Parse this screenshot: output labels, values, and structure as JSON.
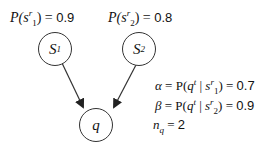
{
  "nodes": [
    {
      "id": "s1",
      "label": "S",
      "sub": "1"
    },
    {
      "id": "s2",
      "label": "S",
      "sub": "2"
    },
    {
      "id": "q",
      "label": "q"
    }
  ],
  "edges": [
    {
      "from": "s1",
      "to": "q"
    },
    {
      "from": "s2",
      "to": "q"
    }
  ],
  "priors": {
    "s1": {
      "func": "P(",
      "var": "s",
      "sup": "r",
      "sub": "1",
      "close": ")",
      "eq": " = ",
      "value": "0.9"
    },
    "s2": {
      "func": "P(",
      "var": "s",
      "sup": "r",
      "sub": "2",
      "close": ")",
      "eq": " = ",
      "value": "0.8"
    }
  },
  "params": {
    "alpha": {
      "symbol": "α",
      "eq1": " = P(",
      "q": "q",
      "qsup": "t",
      "bar": " | ",
      "var": "s",
      "sup": "r",
      "sub": "1",
      "close": ")",
      "eq2": " = ",
      "value": "0.7"
    },
    "beta": {
      "symbol": "β",
      "eq1": " = P(",
      "q": "q",
      "qsup": "t",
      "bar": " | ",
      "var": "s",
      "sup": "r",
      "sub": "2",
      "close": ")",
      "eq2": " = ",
      "value": "0.9"
    },
    "nq": {
      "symbol": "n",
      "sub": "q",
      "eq": " = ",
      "value": "2"
    }
  }
}
